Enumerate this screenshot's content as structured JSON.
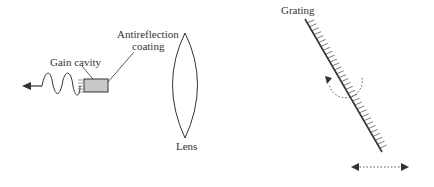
{
  "diagram": {
    "labels": {
      "gain_cavity": "Gain cavity",
      "antireflection_line1": "Antireflection",
      "antireflection_line2": "coating",
      "lens": "Lens",
      "grating": "Grating"
    }
  }
}
